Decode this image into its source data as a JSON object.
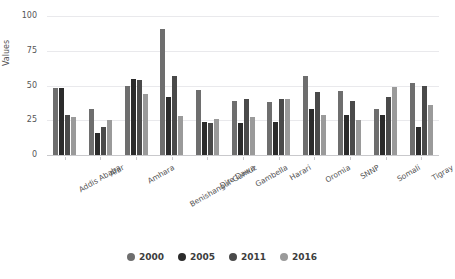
{
  "chart_data": {
    "type": "bar",
    "title": "",
    "xlabel": "",
    "ylabel": "Values",
    "ylim": [
      0,
      100
    ],
    "yticks": [
      0,
      25,
      50,
      75,
      100
    ],
    "grid": true,
    "legend_position": "bottom",
    "categories": [
      "Addis Ababa",
      "Afar",
      "Amhara",
      "Benishangul-Gumuz",
      "Dire Dawa",
      "Gambella",
      "Harari",
      "Oromia",
      "SNNP",
      "Somali",
      "Tigray"
    ],
    "series": [
      {
        "name": "2000",
        "color": "#6e6e6e",
        "values": [
          48,
          33,
          50,
          91,
          47,
          39,
          38,
          57,
          46,
          33,
          52
        ]
      },
      {
        "name": "2005",
        "color": "#2b2b2b",
        "values": [
          48,
          16,
          55,
          42,
          24,
          23,
          24,
          33,
          29,
          29,
          20
        ]
      },
      {
        "name": "2011",
        "color": "#4a4a4a",
        "values": [
          29,
          20,
          54,
          57,
          23,
          40,
          40,
          45,
          39,
          42,
          50
        ]
      },
      {
        "name": "2016",
        "color": "#9a9a9a",
        "values": [
          27,
          25,
          44,
          28,
          26,
          27,
          40,
          29,
          25,
          49,
          36
        ]
      }
    ]
  },
  "legend": {
    "items": [
      {
        "label": "2000",
        "color": "#6e6e6e"
      },
      {
        "label": "2005",
        "color": "#2b2b2b"
      },
      {
        "label": "2011",
        "color": "#4a4a4a"
      },
      {
        "label": "2016",
        "color": "#9a9a9a"
      }
    ]
  },
  "axis": {
    "y_title": "Values",
    "y_tick_labels": [
      "100",
      "75",
      "50",
      "25",
      "0"
    ]
  }
}
